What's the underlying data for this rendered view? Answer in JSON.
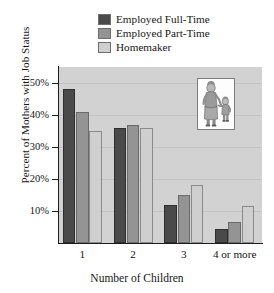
{
  "chart_data": {
    "type": "bar",
    "title": "",
    "xlabel": "Number of Children",
    "ylabel": "Percent of Mothers with Job Status",
    "categories": [
      "1",
      "2",
      "3",
      "4 or more"
    ],
    "series": [
      {
        "name": "Employed Full-Time",
        "color": "#4a4a4a",
        "values": [
          48,
          36,
          12,
          4.5
        ]
      },
      {
        "name": "Employed Part-Time",
        "color": "#949494",
        "values": [
          41,
          37,
          15,
          6.5
        ]
      },
      {
        "name": "Homemaker",
        "color": "#cfcfcf",
        "values": [
          35,
          36,
          18,
          11.5
        ]
      }
    ],
    "ylim": [
      0,
      55
    ],
    "ytick_values": [
      10,
      20,
      30,
      40,
      50
    ],
    "ytick_labels": [
      "10%",
      "20%",
      "30%",
      "40%",
      "50%"
    ],
    "grid": true,
    "legend_position": "top-center",
    "plot_background": "#d2d2d2"
  },
  "legend": {
    "items": [
      {
        "label": "Employed Full-Time"
      },
      {
        "label": "Employed Part-Time"
      },
      {
        "label": "Homemaker"
      }
    ]
  },
  "inset": {
    "name": "mother-and-child-illustration"
  }
}
